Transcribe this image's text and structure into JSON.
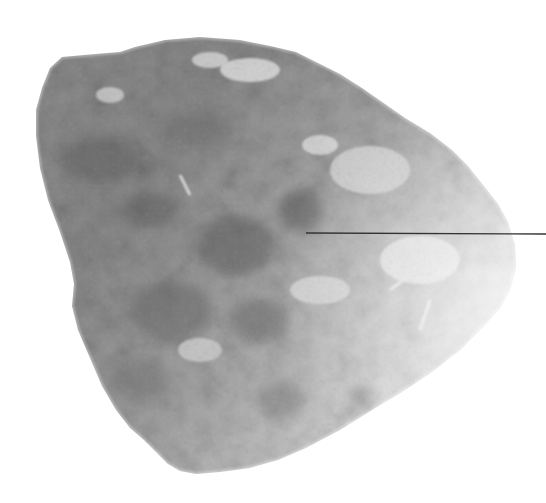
{
  "figure": {
    "background_color": "#ffffff",
    "specimen": {
      "tone_dark": "#6f6f6f",
      "tone_mid": "#9a9a9a",
      "tone_light": "#d9d9d9",
      "highlight": "#f4f4f4"
    },
    "callout": {
      "line_color": "#333333",
      "start": [
        306,
        233
      ],
      "end": [
        546,
        234
      ],
      "label": ""
    }
  }
}
